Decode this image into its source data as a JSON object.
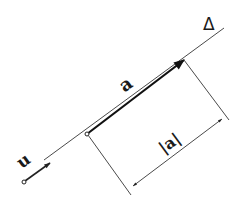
{
  "diagram": {
    "labels": {
      "line": "Δ",
      "unit_vector": "u",
      "vector": "a",
      "magnitude": "|a|"
    },
    "colors": {
      "stroke": "#3a3a3a",
      "bold_stroke": "#111111",
      "background": "#ffffff"
    },
    "geometry": {
      "line_start": [
        44,
        160
      ],
      "line_end": [
        224,
        28
      ],
      "u_origin": [
        24,
        182
      ],
      "u_tip": [
        50,
        163
      ],
      "a_origin": [
        87,
        134
      ],
      "a_tip": [
        184,
        60
      ],
      "perp_tip_end": [
        229,
        120
      ],
      "perp_origin_end": [
        131,
        195
      ],
      "dim_start": [
        133,
        186
      ],
      "dim_end": [
        222,
        119
      ]
    }
  }
}
